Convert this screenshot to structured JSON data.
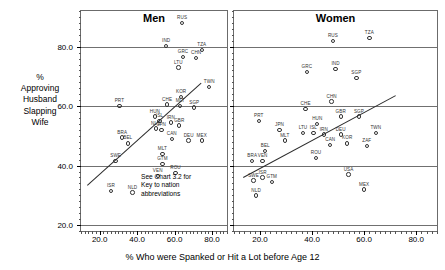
{
  "chart_data": {
    "type": "scatter",
    "title": "",
    "xlabel": "% Who were Spanked or Hit a Lot before Age 12",
    "ylabel": "%\nApproving\nHusband\nSlapping\nWife",
    "xlim": [
      10,
      88
    ],
    "ylim": [
      18,
      92
    ],
    "xticks": [
      "20.0",
      "40.0",
      "60.0",
      "80.0"
    ],
    "xtick_values": [
      20,
      40,
      60,
      80
    ],
    "yticks": [
      "80.0",
      "60.0",
      "40.0",
      "20.0"
    ],
    "ytick_values": [
      80,
      60,
      40,
      20
    ],
    "gridlines": [
      80,
      60,
      40,
      20
    ],
    "grid": true,
    "legend": "none",
    "annotation": "See Chart 3.2 for\nKey to nation\nabbreviations",
    "annotation_line1": "See Chart 3.2 for",
    "annotation_line2": "Key to nation",
    "annotation_line3": "abbreviations",
    "panels": [
      {
        "name": "men",
        "title": "Men",
        "fit_line": {
          "x1": 13.0,
          "y1": 33.5,
          "x2": 74.0,
          "y2": 68.0
        },
        "points": [
          {
            "label": "RUS",
            "x": 64.0,
            "y": 88.0
          },
          {
            "label": "IND",
            "x": 55.5,
            "y": 80.2
          },
          {
            "label": "GRC",
            "x": 64.5,
            "y": 76.5
          },
          {
            "label": "CHN",
            "x": 71.5,
            "y": 76.2
          },
          {
            "label": "TZA",
            "x": 74.5,
            "y": 78.8
          },
          {
            "label": "LTU",
            "x": 62.0,
            "y": 73.0
          },
          {
            "label": "TWN",
            "x": 78.5,
            "y": 66.5
          },
          {
            "label": "PRT",
            "x": 30.5,
            "y": 60.0
          },
          {
            "label": "CHE",
            "x": 56.0,
            "y": 60.5
          },
          {
            "label": "KOR",
            "x": 63.5,
            "y": 63.0
          },
          {
            "label": "SGP",
            "x": 70.5,
            "y": 59.5
          },
          {
            "label": "MLT",
            "x": 63.0,
            "y": 60.0
          },
          {
            "label": "HUN",
            "x": 49.5,
            "y": 56.5
          },
          {
            "label": "ISL",
            "x": 52.0,
            "y": 55.0
          },
          {
            "label": "NLD",
            "x": 50.0,
            "y": 52.5
          },
          {
            "label": "JPN",
            "x": 53.0,
            "y": 52.0
          },
          {
            "label": "IRN",
            "x": 58.0,
            "y": 54.5
          },
          {
            "label": "GBR",
            "x": 62.5,
            "y": 53.5
          },
          {
            "label": "BRA",
            "x": 32.0,
            "y": 49.5
          },
          {
            "label": "BEL",
            "x": 35.0,
            "y": 47.5
          },
          {
            "label": "CAN",
            "x": 58.5,
            "y": 49.0
          },
          {
            "label": "DEU",
            "x": 67.5,
            "y": 48.5
          },
          {
            "label": "MEX",
            "x": 74.5,
            "y": 48.5
          },
          {
            "label": "MLT2",
            "x": 53.5,
            "y": 44.0
          },
          {
            "label": "SWE",
            "x": 28.5,
            "y": 41.5
          },
          {
            "label": "GTM",
            "x": 53.5,
            "y": 40.5
          },
          {
            "label": "ROU",
            "x": 60.5,
            "y": 37.5
          },
          {
            "label": "VEN",
            "x": 51.0,
            "y": 36.5
          },
          {
            "label": "ISR",
            "x": 26.0,
            "y": 31.5
          },
          {
            "label": "NLD2",
            "x": 37.5,
            "y": 31.0
          }
        ]
      },
      {
        "name": "women",
        "title": "Women",
        "fit_line": {
          "x1": 13.5,
          "y1": 36.0,
          "x2": 72.0,
          "y2": 63.5
        },
        "points": [
          {
            "label": "RUS",
            "x": 48.0,
            "y": 82.0
          },
          {
            "label": "TZA",
            "x": 62.0,
            "y": 83.0
          },
          {
            "label": "GRC",
            "x": 38.0,
            "y": 71.5
          },
          {
            "label": "IND",
            "x": 49.0,
            "y": 72.5
          },
          {
            "label": "SGP",
            "x": 57.0,
            "y": 69.5
          },
          {
            "label": "CHN",
            "x": 47.5,
            "y": 61.5
          },
          {
            "label": "CHE",
            "x": 37.5,
            "y": 59.0
          },
          {
            "label": "GBR",
            "x": 51.0,
            "y": 56.5
          },
          {
            "label": "SGP2",
            "x": 58.0,
            "y": 56.5
          },
          {
            "label": "PRT",
            "x": 19.5,
            "y": 55.0
          },
          {
            "label": "JPN",
            "x": 27.5,
            "y": 52.0
          },
          {
            "label": "HUN",
            "x": 42.0,
            "y": 54.0
          },
          {
            "label": "LTU",
            "x": 36.5,
            "y": 51.0
          },
          {
            "label": "ISL",
            "x": 40.5,
            "y": 51.0
          },
          {
            "label": "MLT",
            "x": 29.5,
            "y": 48.5
          },
          {
            "label": "IRN",
            "x": 44.5,
            "y": 50.5
          },
          {
            "label": "DEU",
            "x": 51.0,
            "y": 50.5
          },
          {
            "label": "TWN",
            "x": 64.5,
            "y": 51.0
          },
          {
            "label": "CAN",
            "x": 47.0,
            "y": 47.0
          },
          {
            "label": "KOR",
            "x": 53.5,
            "y": 47.5
          },
          {
            "label": "ZAF",
            "x": 61.0,
            "y": 46.5
          },
          {
            "label": "BEL",
            "x": 22.0,
            "y": 45.0
          },
          {
            "label": "ROU",
            "x": 41.5,
            "y": 42.5
          },
          {
            "label": "BRA",
            "x": 17.0,
            "y": 41.5
          },
          {
            "label": "VEN",
            "x": 21.0,
            "y": 41.5
          },
          {
            "label": "USA",
            "x": 54.0,
            "y": 37.0
          },
          {
            "label": "SWE",
            "x": 17.5,
            "y": 35.0
          },
          {
            "label": "ISR",
            "x": 21.0,
            "y": 36.0
          },
          {
            "label": "GTM",
            "x": 24.5,
            "y": 34.5
          },
          {
            "label": "MEX",
            "x": 60.0,
            "y": 32.0
          },
          {
            "label": "NLD",
            "x": 18.5,
            "y": 30.0
          }
        ]
      }
    ]
  }
}
